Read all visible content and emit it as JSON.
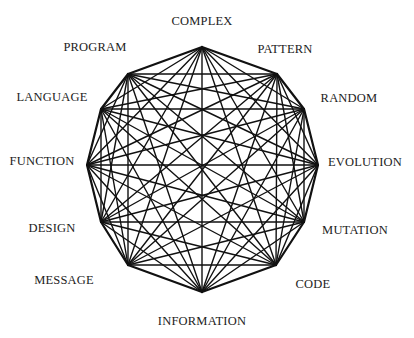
{
  "diagram": {
    "type": "complete-graph",
    "nodes": [
      {
        "id": "complex",
        "label": "COMPLEX"
      },
      {
        "id": "pattern",
        "label": "PATTERN"
      },
      {
        "id": "random",
        "label": "RANDOM"
      },
      {
        "id": "evolution",
        "label": "EVOLUTION"
      },
      {
        "id": "mutation",
        "label": "MUTATION"
      },
      {
        "id": "code",
        "label": "CODE"
      },
      {
        "id": "information",
        "label": "INFORMATION"
      },
      {
        "id": "message",
        "label": "MESSAGE"
      },
      {
        "id": "design",
        "label": "DESIGN"
      },
      {
        "id": "function",
        "label": "FUNCTION"
      },
      {
        "id": "language",
        "label": "LANGUAGE"
      },
      {
        "id": "program",
        "label": "PROGRAM"
      }
    ],
    "edges": "all-pairs",
    "colors": {
      "line": "#111111",
      "text": "#222222",
      "background": "#ffffff"
    }
  }
}
